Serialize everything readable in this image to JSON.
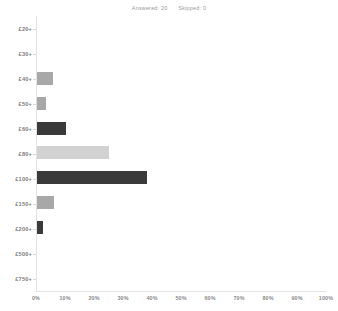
{
  "header": {
    "answered_label": "Answered: 20",
    "skipped_label": "Skipped: 0"
  },
  "chart_data": {
    "type": "bar",
    "orientation": "horizontal",
    "title": "",
    "xlabel": "",
    "ylabel": "",
    "xlim": [
      0,
      100
    ],
    "grid": false,
    "legend": "none",
    "categories": [
      "£20+",
      "£30+",
      "£40+",
      "£50+",
      "£60+",
      "£80+",
      "£100+",
      "£150+",
      "£200+",
      "£500+",
      "£750+"
    ],
    "values": [
      0,
      0,
      5.5,
      3,
      10,
      25,
      38,
      6,
      2,
      0,
      0
    ],
    "bar_colors": [
      "#a8a8a8",
      "#a8a8a8",
      "#a8a8a8",
      "#a8a8a8",
      "#3a3a3a",
      "#d2d2d2",
      "#3a3a3a",
      "#a8a8a8",
      "#3a3a3a",
      "#a8a8a8",
      "#a8a8a8"
    ],
    "xticks": [
      0,
      10,
      20,
      30,
      40,
      50,
      60,
      70,
      80,
      90,
      100
    ],
    "xtick_labels": [
      "0%",
      "10%",
      "20%",
      "30%",
      "40%",
      "50%",
      "60%",
      "70%",
      "80%",
      "90%",
      "100%"
    ]
  },
  "colors": {
    "axis": "#e3e3e3",
    "tick_text": "#8b8b8b",
    "category_text": "#7d7d7d",
    "header_text": "#9a9a9a",
    "background": "#ffffff"
  }
}
